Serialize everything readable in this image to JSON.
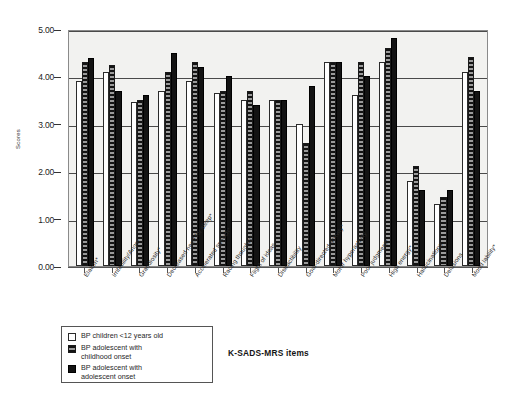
{
  "chart_data": {
    "type": "bar",
    "title": "",
    "xlabel": "K-SADS-MRS items",
    "ylabel": "Scores",
    "ylim": [
      0,
      5
    ],
    "yticks": [
      "0.00",
      "1.00",
      "2.00",
      "3.00",
      "4.00",
      "5.00"
    ],
    "grid": true,
    "legend_position": "bottom-left",
    "categories": [
      "Elation*",
      "Irritability/Anger",
      "Grandiosity*",
      "Decreased need for sleep*",
      "Accelerated speech*",
      "Racing thoughts*",
      "Flight of ideas",
      "Distractibility",
      "Goal-directed activity*",
      "Motor hyperactivity",
      "Poor judgment*",
      "High energy*",
      "Hallucinations",
      "Delusions",
      "Mood lability*"
    ],
    "series": [
      {
        "name": "BP children <12 years old",
        "values": [
          3.9,
          4.1,
          3.45,
          3.7,
          3.9,
          3.65,
          3.5,
          3.5,
          3.0,
          4.3,
          3.6,
          4.3,
          1.8,
          1.3,
          4.1
        ]
      },
      {
        "name": "BP adolescent with childhood onset",
        "values": [
          4.3,
          4.25,
          3.5,
          4.1,
          4.3,
          3.7,
          3.7,
          3.5,
          2.6,
          4.3,
          4.3,
          4.6,
          2.1,
          1.45,
          4.4
        ]
      },
      {
        "name": "BP adolescent with adolescent onset",
        "values": [
          4.38,
          3.7,
          3.6,
          4.5,
          4.2,
          4.0,
          3.4,
          3.5,
          3.8,
          4.3,
          4.0,
          4.8,
          1.6,
          1.6,
          3.7
        ]
      }
    ]
  },
  "legend": {
    "entries": [
      {
        "label": "BP children <12 years old",
        "swatch": "open-square-swatch"
      },
      {
        "label": "BP adolescent with\nchildhood onset",
        "swatch": "hatched-square-swatch"
      },
      {
        "label": "BP adolescent with\nadolescent onset",
        "swatch": "solid-square-swatch"
      }
    ]
  }
}
